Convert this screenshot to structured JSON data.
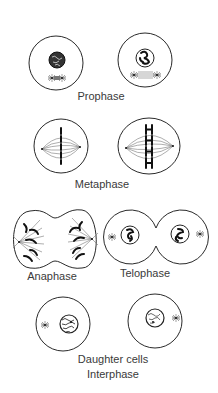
{
  "diagram": {
    "stages": [
      {
        "id": "prophase",
        "label": "Prophase",
        "cells": 2
      },
      {
        "id": "metaphase",
        "label": "Metaphase",
        "cells": 2
      },
      {
        "id": "anaphase",
        "label": "Anaphase",
        "cells": 1
      },
      {
        "id": "telophase",
        "label": "Telophase",
        "cells": 1
      },
      {
        "id": "interphase",
        "label": "Daughter cells",
        "sublabel": "Interphase",
        "cells": 2
      }
    ],
    "colors": {
      "background": "#ffffff",
      "outline": "#2a2a2a",
      "chromosome": "#111111",
      "text": "#3a3a3a"
    }
  }
}
